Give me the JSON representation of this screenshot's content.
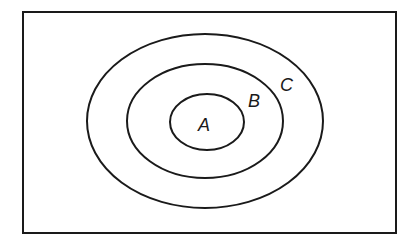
{
  "diagram": {
    "type": "nested-sets",
    "universe": {
      "label": ""
    },
    "sets": [
      {
        "id": "C",
        "label": "C",
        "contains": [
          "B"
        ]
      },
      {
        "id": "B",
        "label": "B",
        "contains": [
          "A"
        ]
      },
      {
        "id": "A",
        "label": "A",
        "contains": []
      }
    ],
    "colors": {
      "stroke": "#1a1a1a",
      "background": "#ffffff"
    }
  }
}
